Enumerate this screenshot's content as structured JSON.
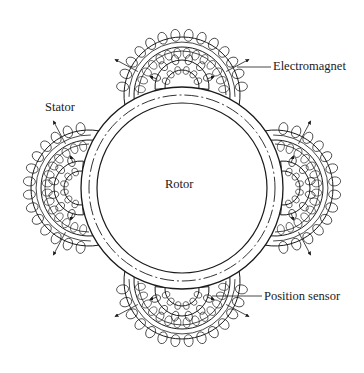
{
  "diagram": {
    "title": "",
    "stroke_color": "#1a1a1a",
    "background": "#ffffff",
    "center": {
      "x": 182,
      "y": 188
    },
    "stator_ring": {
      "outer_radius": 101,
      "dashed_radius": 93
    },
    "rotor": {
      "radius": 85,
      "label": "Rotor"
    },
    "labels": {
      "electromagnet": "Electromagnet",
      "stator": "Stator",
      "rotor": "Rotor",
      "position_sensor": "Position sensor"
    },
    "electromagnets": [
      {
        "name": "top",
        "angle_deg": -90
      },
      {
        "name": "right",
        "angle_deg": 0
      },
      {
        "name": "bottom",
        "angle_deg": 90
      },
      {
        "name": "left",
        "angle_deg": 180
      }
    ],
    "components": [
      "Stator",
      "Rotor",
      "Electromagnet x4",
      "Position sensor"
    ]
  }
}
